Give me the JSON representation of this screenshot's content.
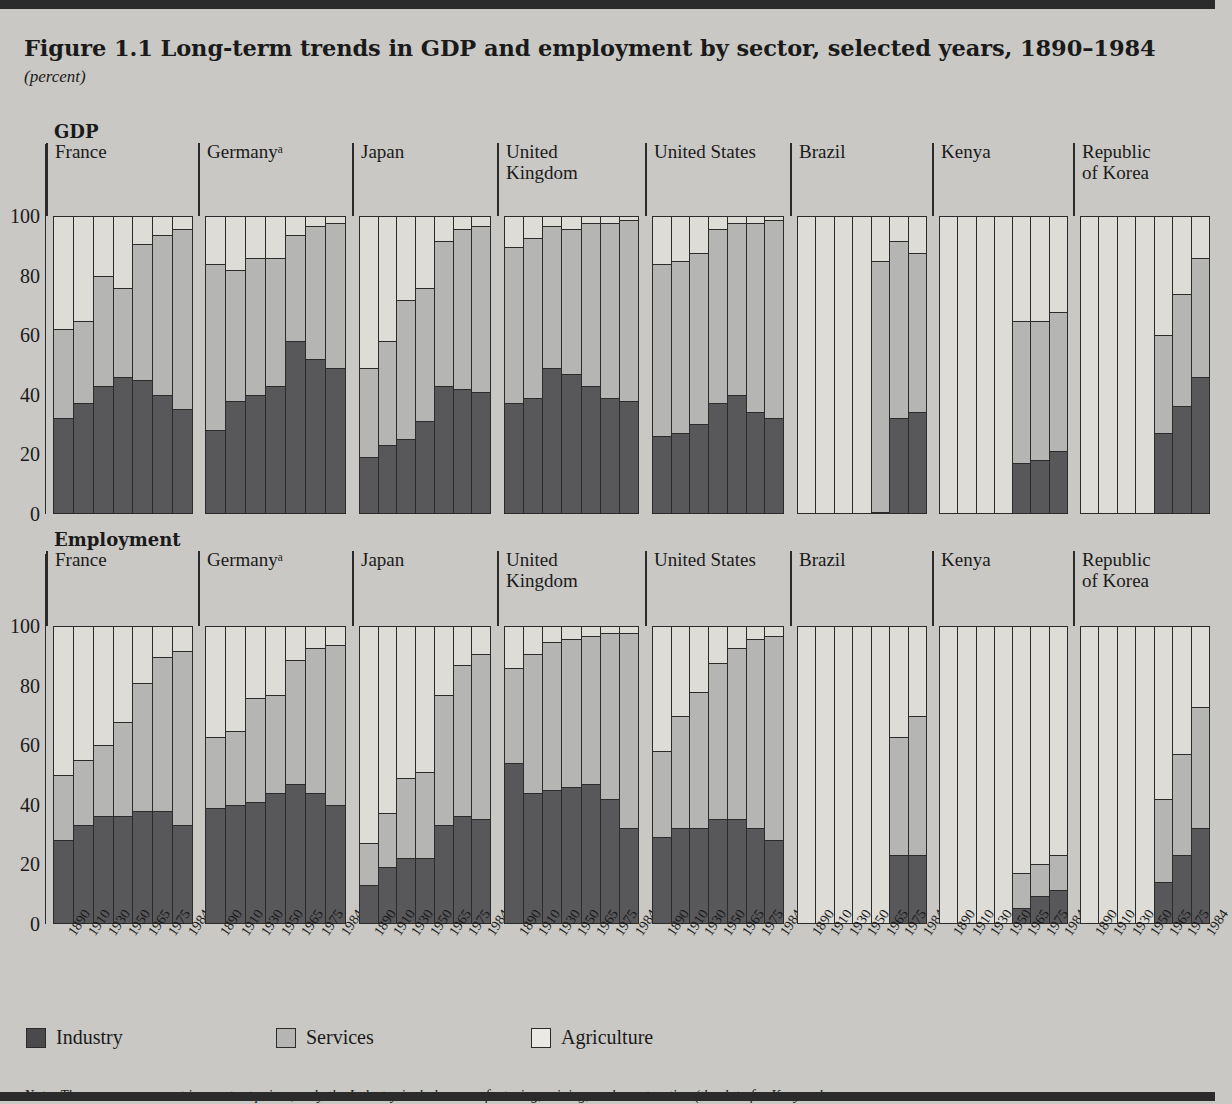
{
  "figure": {
    "title": "Figure 1.1  Long-term trends in GDP and employment by sector, selected years, 1890–1984",
    "units": "(percent)",
    "note": "Note: The measures are not in constant prices; only the Industry includes manufacturing, mining, and construction (the data for Kenya also"
  },
  "sections": [
    {
      "key": "gdp",
      "label": "GDP"
    },
    {
      "key": "employment",
      "label": "Employment"
    }
  ],
  "legend": [
    {
      "key": "industry",
      "label": "Industry",
      "color": "#4a4a4c"
    },
    {
      "key": "services",
      "label": "Services",
      "color": "#b5b5b3"
    },
    {
      "key": "agriculture",
      "label": "Agriculture",
      "color": "#ebe9e4"
    }
  ],
  "axis": {
    "ticks": [
      "100",
      "80",
      "60",
      "40",
      "20",
      "0"
    ],
    "min": 0,
    "max": 100
  },
  "years": [
    "1890",
    "1910",
    "1930",
    "1950",
    "1965",
    "1975",
    "1984"
  ],
  "countries": [
    "France",
    "Germanyᵃ",
    "Japan",
    "United\nKingdom",
    "United States",
    "Brazil",
    "Kenya",
    "Republic\nof Korea"
  ],
  "chart_data": {
    "type": "bar",
    "title": "Figure 1.1  Long-term trends in GDP and employment by sector, selected years, 1890–1984",
    "subtitle": "(percent)",
    "stacked": true,
    "normalized": true,
    "xlabel": "",
    "ylabel": "percent",
    "ylim": [
      0,
      100
    ],
    "grid": false,
    "legend_position": "bottom-left",
    "categories": [
      "1890",
      "1910",
      "1930",
      "1950",
      "1965",
      "1975",
      "1984"
    ],
    "series_names": [
      "Industry",
      "Services",
      "Agriculture"
    ],
    "series_colors": [
      "#4a4a4c",
      "#b5b5b3",
      "#ebe9e4"
    ],
    "panels": [
      {
        "section": "GDP",
        "panels": [
          {
            "country": "France",
            "industry": [
              32,
              37,
              43,
              46,
              45,
              40,
              35
            ],
            "services": [
              30,
              28,
              37,
              30,
              46,
              54,
              61
            ],
            "agriculture": [
              38,
              35,
              20,
              24,
              9,
              6,
              4
            ]
          },
          {
            "country": "Germanyᵃ",
            "industry": [
              28,
              38,
              40,
              43,
              58,
              52,
              49
            ],
            "services": [
              56,
              44,
              46,
              43,
              36,
              45,
              49
            ],
            "agriculture": [
              16,
              18,
              14,
              14,
              6,
              3,
              2
            ]
          },
          {
            "country": "Japan",
            "industry": [
              19,
              23,
              25,
              31,
              43,
              42,
              41
            ],
            "services": [
              30,
              35,
              47,
              45,
              49,
              54,
              56
            ],
            "agriculture": [
              51,
              42,
              28,
              24,
              8,
              4,
              3
            ]
          },
          {
            "country": "United Kingdom",
            "industry": [
              37,
              39,
              49,
              47,
              43,
              39,
              38
            ],
            "services": [
              53,
              54,
              48,
              49,
              55,
              59,
              61
            ],
            "agriculture": [
              10,
              7,
              3,
              4,
              2,
              2,
              1
            ]
          },
          {
            "country": "United States",
            "industry": [
              26,
              27,
              30,
              37,
              40,
              34,
              32
            ],
            "services": [
              58,
              58,
              58,
              59,
              58,
              64,
              67
            ],
            "agriculture": [
              16,
              15,
              12,
              4,
              2,
              2,
              1
            ]
          },
          {
            "country": "Brazil",
            "industry": [
              null,
              null,
              null,
              null,
              0,
              32,
              34
            ],
            "services": [
              null,
              null,
              null,
              null,
              85,
              60,
              54
            ],
            "agriculture": [
              null,
              null,
              null,
              null,
              15,
              8,
              12
            ]
          },
          {
            "country": "Kenya",
            "industry": [
              null,
              null,
              null,
              null,
              17,
              18,
              21
            ],
            "services": [
              null,
              null,
              null,
              null,
              48,
              47,
              47
            ],
            "agriculture": [
              null,
              null,
              null,
              null,
              35,
              35,
              32
            ]
          },
          {
            "country": "Republic of Korea",
            "industry": [
              null,
              null,
              null,
              null,
              27,
              36,
              46
            ],
            "services": [
              null,
              null,
              null,
              null,
              33,
              38,
              40
            ],
            "agriculture": [
              null,
              null,
              null,
              null,
              40,
              26,
              14
            ]
          }
        ]
      },
      {
        "section": "Employment",
        "panels": [
          {
            "country": "France",
            "industry": [
              28,
              33,
              36,
              36,
              38,
              38,
              33
            ],
            "services": [
              22,
              22,
              24,
              32,
              43,
              52,
              59
            ],
            "agriculture": [
              50,
              45,
              40,
              32,
              19,
              10,
              8
            ]
          },
          {
            "country": "Germanyᵃ",
            "industry": [
              39,
              40,
              41,
              44,
              47,
              44,
              40
            ],
            "services": [
              24,
              25,
              35,
              33,
              42,
              49,
              54
            ],
            "agriculture": [
              37,
              35,
              24,
              23,
              11,
              7,
              6
            ]
          },
          {
            "country": "Japan",
            "industry": [
              13,
              19,
              22,
              22,
              33,
              36,
              35
            ],
            "services": [
              14,
              18,
              27,
              29,
              44,
              51,
              56
            ],
            "agriculture": [
              73,
              63,
              51,
              49,
              23,
              13,
              9
            ]
          },
          {
            "country": "United Kingdom",
            "industry": [
              54,
              44,
              45,
              46,
              47,
              42,
              32
            ],
            "services": [
              32,
              47,
              50,
              50,
              50,
              56,
              66
            ],
            "agriculture": [
              14,
              9,
              5,
              4,
              3,
              2,
              2
            ]
          },
          {
            "country": "United States",
            "industry": [
              29,
              32,
              32,
              35,
              35,
              32,
              28
            ],
            "services": [
              29,
              38,
              46,
              53,
              58,
              64,
              69
            ],
            "agriculture": [
              42,
              30,
              22,
              12,
              7,
              4,
              3
            ]
          },
          {
            "country": "Brazil",
            "industry": [
              null,
              null,
              null,
              null,
              null,
              23,
              23
            ],
            "services": [
              null,
              null,
              null,
              null,
              null,
              40,
              47
            ],
            "agriculture": [
              null,
              null,
              null,
              null,
              null,
              37,
              30
            ]
          },
          {
            "country": "Kenya",
            "industry": [
              null,
              null,
              null,
              null,
              5,
              9,
              11
            ],
            "services": [
              null,
              null,
              null,
              null,
              12,
              11,
              12
            ],
            "agriculture": [
              null,
              null,
              null,
              null,
              83,
              80,
              77
            ]
          },
          {
            "country": "Republic of Korea",
            "industry": [
              null,
              null,
              null,
              null,
              14,
              23,
              32
            ],
            "services": [
              null,
              null,
              null,
              null,
              28,
              34,
              41
            ],
            "agriculture": [
              null,
              null,
              null,
              null,
              58,
              43,
              27
            ]
          }
        ]
      }
    ]
  }
}
